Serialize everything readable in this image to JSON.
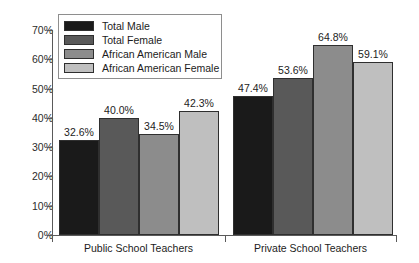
{
  "chart_data": {
    "type": "bar",
    "title": "",
    "subtitle": "",
    "xlabel": "",
    "ylabel": "",
    "categories": [
      "Public School Teachers",
      "Private School Teachers"
    ],
    "series": [
      {
        "name": "Total Male",
        "color": "#1a1a1a",
        "values": [
          32.6,
          47.4
        ],
        "labels": [
          "32.6%",
          "47.4%"
        ]
      },
      {
        "name": "Total Female",
        "color": "#595959",
        "values": [
          40.0,
          53.6
        ],
        "labels": [
          "40.0%",
          "53.6%"
        ]
      },
      {
        "name": "African American Male",
        "color": "#8c8c8c",
        "values": [
          34.5,
          64.8
        ],
        "labels": [
          "34.5%",
          "64.8%"
        ]
      },
      {
        "name": "African American Female",
        "color": "#bfbfbf",
        "values": [
          42.3,
          59.1
        ],
        "labels": [
          "42.3%",
          "59.1%"
        ]
      }
    ],
    "ylim": [
      0,
      70
    ],
    "ytick_values": [
      0,
      10,
      20,
      30,
      40,
      50,
      60,
      70
    ],
    "ytick_labels": [
      "0%",
      "10%",
      "20%",
      "30%",
      "40%",
      "50%",
      "60%",
      "70%"
    ],
    "grid": false,
    "legend_position": "upper-left-inside",
    "legend_entries": [
      "Total Male",
      "Total Female",
      "African American Male",
      "African American Female"
    ]
  },
  "legend": {
    "items": [
      {
        "label": "Total Male",
        "color": "#1a1a1a"
      },
      {
        "label": "Total Female",
        "color": "#595959"
      },
      {
        "label": "African American Male",
        "color": "#8c8c8c"
      },
      {
        "label": "African American Female",
        "color": "#bfbfbf"
      }
    ]
  },
  "axis": {
    "y_labels": [
      "70%",
      "60%",
      "50%",
      "40%",
      "30%",
      "20%",
      "10%",
      "0%"
    ],
    "x_labels": [
      "Public School Teachers",
      "Private School Teachers"
    ]
  }
}
